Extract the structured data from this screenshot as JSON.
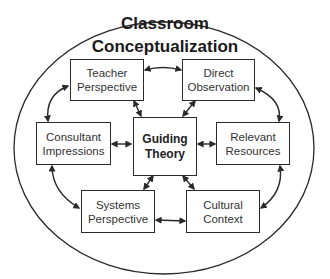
{
  "diagram": {
    "title_line1": "Classroom",
    "title_line2": "Conceptualization",
    "center": {
      "line1": "Guiding",
      "line2": "Theory"
    },
    "nodes": [
      {
        "id": "teacher-perspective",
        "line1": "Teacher",
        "line2": "Perspective"
      },
      {
        "id": "direct-observation",
        "line1": "Direct",
        "line2": "Observation"
      },
      {
        "id": "consultant-impressions",
        "line1": "Consultant",
        "line2": "Impressions"
      },
      {
        "id": "relevant-resources",
        "line1": "Relevant",
        "line2": "Resources"
      },
      {
        "id": "systems-perspective",
        "line1": "Systems",
        "line2": "Perspective"
      },
      {
        "id": "cultural-context",
        "line1": "Cultural",
        "line2": "Context"
      }
    ],
    "edges": [
      [
        "teacher-perspective",
        "direct-observation"
      ],
      [
        "direct-observation",
        "relevant-resources"
      ],
      [
        "relevant-resources",
        "cultural-context"
      ],
      [
        "cultural-context",
        "systems-perspective"
      ],
      [
        "systems-perspective",
        "consultant-impressions"
      ],
      [
        "consultant-impressions",
        "teacher-perspective"
      ],
      [
        "guiding-theory",
        "teacher-perspective"
      ],
      [
        "guiding-theory",
        "direct-observation"
      ],
      [
        "guiding-theory",
        "consultant-impressions"
      ],
      [
        "guiding-theory",
        "relevant-resources"
      ],
      [
        "guiding-theory",
        "systems-perspective"
      ],
      [
        "guiding-theory",
        "cultural-context"
      ]
    ],
    "colors": {
      "stroke": "#2a2a2a",
      "text": "#333333",
      "background": "#ffffff"
    }
  }
}
